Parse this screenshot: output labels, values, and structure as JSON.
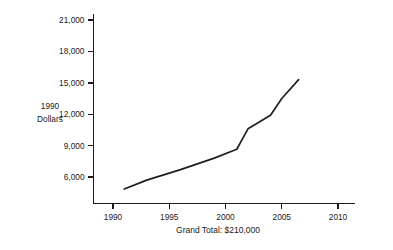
{
  "chart_data": {
    "type": "line",
    "title": "",
    "subtitle": "",
    "xlabel": "",
    "ylabel": "1990 Dollars",
    "ylabel_lines": [
      "1990",
      "Dollars"
    ],
    "caption": "Grand Total: $210,000",
    "grid": false,
    "legend": "none",
    "xlim": [
      1988.5,
      2011.5
    ],
    "ylim": [
      4200,
      22000
    ],
    "x_ticks": [
      1990,
      1995,
      2000,
      2005,
      2010
    ],
    "x_tick_labels": [
      "1990",
      "1995",
      "2000",
      "2005",
      "2010"
    ],
    "y_ticks": [
      6000,
      9000,
      12000,
      15000,
      18000,
      21000
    ],
    "y_tick_labels": [
      "6,000",
      "9,000",
      "12,000",
      "15,000",
      "18,000",
      "21,000"
    ],
    "line_color": "#1f1f1f",
    "axis_color": "#1a1a1a",
    "series": [
      {
        "name": "1990 Dollars",
        "x": [
          1991.0,
          1993.0,
          1996.0,
          1999.0,
          2001.0,
          2002.0,
          2004.0,
          2005.0,
          2006.5
        ],
        "values": [
          4850,
          5700,
          6700,
          7800,
          8650,
          10600,
          11900,
          13500,
          15300
        ]
      }
    ]
  },
  "axis_labels": {
    "y_title_line1": "1990",
    "y_title_line2": "Dollars"
  },
  "footer": {
    "grand_total": "Grand Total: $210,000"
  }
}
